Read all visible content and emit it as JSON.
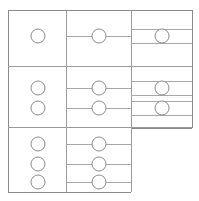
{
  "diagram": {
    "type": "node-grid-diagram",
    "canvas": {
      "width": 199,
      "height": 201,
      "background": "#ffffff"
    },
    "colors": {
      "frame_stroke": "#8a8a8a",
      "divider_stroke": "#9a9a9a",
      "connector_stroke": "#a8a8a8",
      "node_stroke": "#8c8c8c",
      "node_fill": "#ffffff"
    },
    "frame": {
      "x": 8,
      "y": 10,
      "width": 184,
      "height": 182
    },
    "columns": [
      {
        "name": "column-left",
        "x_start": 8,
        "x_end": 66,
        "y_start": 10,
        "y_end": 192
      },
      {
        "name": "column-middle",
        "x_start": 66,
        "x_end": 131,
        "y_start": 10,
        "y_end": 192
      },
      {
        "name": "column-right",
        "x_start": 131,
        "x_end": 192,
        "y_start": 10,
        "y_end": 128
      }
    ],
    "row_group_dividers_y": [
      66,
      127
    ],
    "row_groups": [
      {
        "name": "group-top",
        "y_start": 10,
        "y_end": 66,
        "left_nodes": [
          {
            "cx": 38,
            "cy": 36,
            "r": 7
          }
        ],
        "middle_nodes": [
          {
            "cx": 99,
            "cy": 36,
            "r": 7
          }
        ],
        "right_nodes": [
          {
            "cx": 162,
            "cy": 36,
            "r": 7
          }
        ],
        "connectors": [
          {
            "x1": 66,
            "x2": 131,
            "y": 36
          }
        ],
        "right_rails_y": [
          29,
          43
        ]
      },
      {
        "name": "group-middle",
        "y_start": 66,
        "y_end": 127,
        "left_nodes": [
          {
            "cx": 38,
            "cy": 88,
            "r": 7
          },
          {
            "cx": 38,
            "cy": 108,
            "r": 7
          }
        ],
        "middle_nodes": [
          {
            "cx": 99,
            "cy": 88,
            "r": 7
          },
          {
            "cx": 99,
            "cy": 108,
            "r": 7
          }
        ],
        "right_nodes": [
          {
            "cx": 162,
            "cy": 88,
            "r": 7
          },
          {
            "cx": 162,
            "cy": 108,
            "r": 7
          }
        ],
        "connectors": [
          {
            "x1": 66,
            "x2": 131,
            "y": 88
          },
          {
            "x1": 66,
            "x2": 131,
            "y": 108
          }
        ],
        "right_rails_y": [
          81,
          95,
          101,
          115
        ]
      },
      {
        "name": "group-bottom",
        "y_start": 127,
        "y_end": 192,
        "left_nodes": [
          {
            "cx": 38,
            "cy": 144,
            "r": 7
          },
          {
            "cx": 38,
            "cy": 164,
            "r": 7
          },
          {
            "cx": 38,
            "cy": 182,
            "r": 7
          }
        ],
        "middle_nodes": [
          {
            "cx": 99,
            "cy": 144,
            "r": 7
          },
          {
            "cx": 99,
            "cy": 164,
            "r": 7
          },
          {
            "cx": 99,
            "cy": 182,
            "r": 7
          }
        ],
        "right_nodes": [],
        "connectors": [
          {
            "x1": 66,
            "x2": 131,
            "y": 144
          },
          {
            "x1": 66,
            "x2": 131,
            "y": 164
          },
          {
            "x1": 66,
            "x2": 131,
            "y": 182
          }
        ],
        "right_rails_y": []
      }
    ],
    "node_count": {
      "left": 6,
      "middle": 6,
      "right": 3,
      "total": 15
    }
  }
}
